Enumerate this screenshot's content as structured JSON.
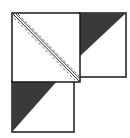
{
  "diagram": {
    "type": "quilt-block-assembly",
    "colors": {
      "background": "#ffffff",
      "outline": "#1a1a1a",
      "dark_fabric": "#3a3a3a",
      "stitch_line": "#555555"
    },
    "pieces": [
      {
        "id": "large-square",
        "description": "large white square with diagonal seam and dashed stitching lines"
      },
      {
        "id": "right-hst",
        "description": "half-square triangle, dark upper-left"
      },
      {
        "id": "bottom-hst",
        "description": "half-square triangle, dark upper-left"
      }
    ]
  }
}
